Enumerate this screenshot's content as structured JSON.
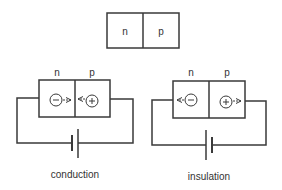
{
  "top_junction": {
    "left_label": "n",
    "right_label": "p"
  },
  "diagrams": [
    {
      "name": "conduction",
      "caption": "conduction",
      "left_label": "n",
      "right_label": "p",
      "left_charge": "−",
      "right_charge": "+",
      "arrows": "toward-junction"
    },
    {
      "name": "insulation",
      "caption": "insulation",
      "left_label": "n",
      "right_label": "p",
      "left_charge": "−",
      "right_charge": "+",
      "arrows": "away-from-junction"
    }
  ],
  "colors": {
    "line": "#3a3a3a",
    "text": "#333333",
    "background": "#ffffff"
  }
}
